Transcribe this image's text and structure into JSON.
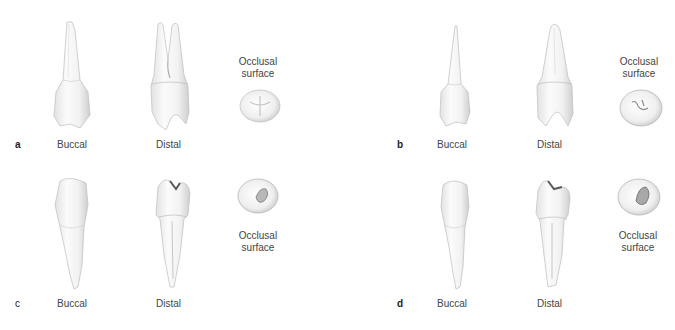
{
  "figure": {
    "panels": [
      {
        "id": "a",
        "letter": "a",
        "views": {
          "buccal": "Buccal",
          "distal": "Distal",
          "occlusal_line1": "Occlusal",
          "occlusal_line2": "surface"
        },
        "tooth_type": "maxillary premolar, two roots (distal view shows bifurcated root)"
      },
      {
        "id": "b",
        "letter": "b",
        "views": {
          "buccal": "Buccal",
          "distal": "Distal",
          "occlusal_line1": "Occlusal",
          "occlusal_line2": "surface"
        },
        "tooth_type": "maxillary premolar, single root"
      },
      {
        "id": "c",
        "letter": "c",
        "views": {
          "buccal": "Buccal",
          "distal": "Distal",
          "occlusal_line1": "Occlusal",
          "occlusal_line2": "surface"
        },
        "tooth_type": "mandibular premolar, single root"
      },
      {
        "id": "d",
        "letter": "d",
        "views": {
          "buccal": "Buccal",
          "distal": "Distal",
          "occlusal_line1": "Occlusal",
          "occlusal_line2": "surface"
        },
        "tooth_type": "mandibular premolar, single root"
      }
    ],
    "colors": {
      "background": "#ffffff",
      "tooth_fill": "#f7f7f7",
      "tooth_shade": "#d6d6d6",
      "tooth_outline": "#b5b5b5",
      "text": "#444444"
    }
  }
}
